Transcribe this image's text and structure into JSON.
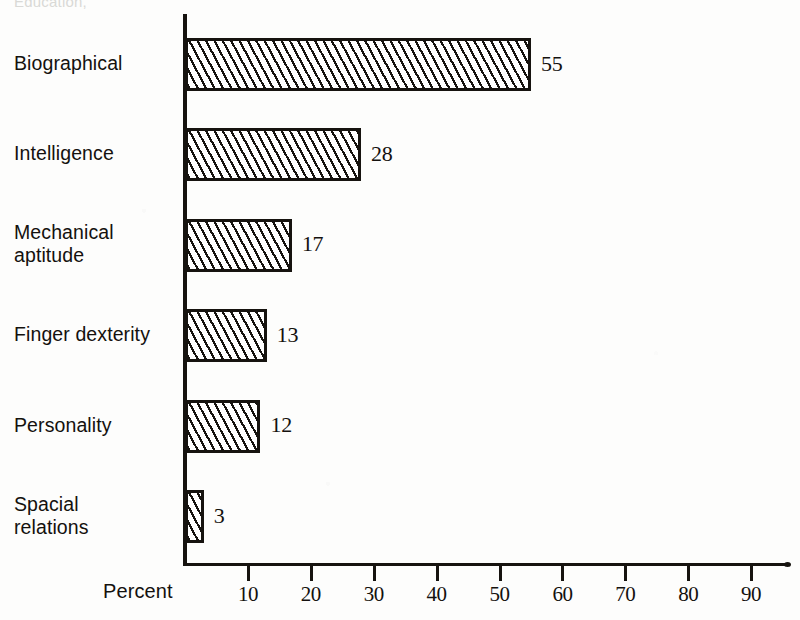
{
  "chart_data": {
    "type": "bar",
    "orientation": "horizontal",
    "title": "",
    "cut_off_caption": "Education,",
    "categories": [
      "Biographical",
      "Intelligence",
      "Mechanical aptitude",
      "Finger dexterity",
      "Personality",
      "Spacial relations"
    ],
    "category_lines": [
      [
        "Biographical"
      ],
      [
        "Intelligence"
      ],
      [
        "Mechanical",
        "aptitude"
      ],
      [
        "Finger dexterity"
      ],
      [
        "Personality"
      ],
      [
        "Spacial",
        "relations"
      ]
    ],
    "values": [
      55,
      28,
      17,
      13,
      12,
      3
    ],
    "value_labels": [
      "55",
      "28",
      "17",
      "13",
      "12",
      "3"
    ],
    "xlabel": "Percent",
    "ylabel": "",
    "xlim": [
      0,
      96
    ],
    "xticks": [
      10,
      20,
      30,
      40,
      50,
      60,
      70,
      80,
      90
    ],
    "xtick_labels": [
      "10",
      "20",
      "30",
      "40",
      "50",
      "60",
      "70",
      "80",
      "90"
    ],
    "grid": false,
    "legend": null,
    "bar_fill": "diagonal-hatch",
    "colors": {
      "ink": "#16130f",
      "background": "#fdfdfc",
      "bar_fill_background": "#ffffff",
      "hatch": "#16130f"
    }
  }
}
